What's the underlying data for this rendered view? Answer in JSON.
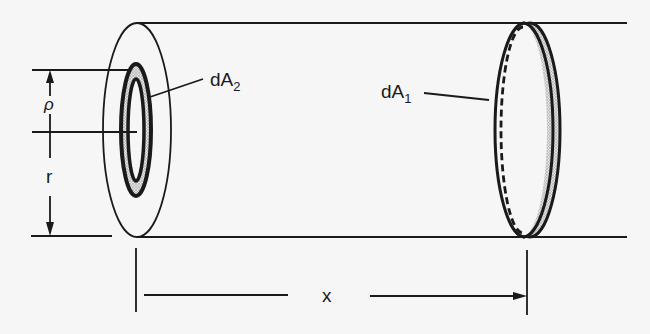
{
  "figure": {
    "colors": {
      "background": "#f6f6f6",
      "stroke": "#1a1a1a",
      "shading": "#c9c9c9"
    },
    "labels": {
      "dA2_main": "dA",
      "dA2_sub": "2",
      "dA1_main": "dA",
      "dA1_sub": "1",
      "rho": "ρ",
      "r": "r",
      "x": "x"
    }
  }
}
